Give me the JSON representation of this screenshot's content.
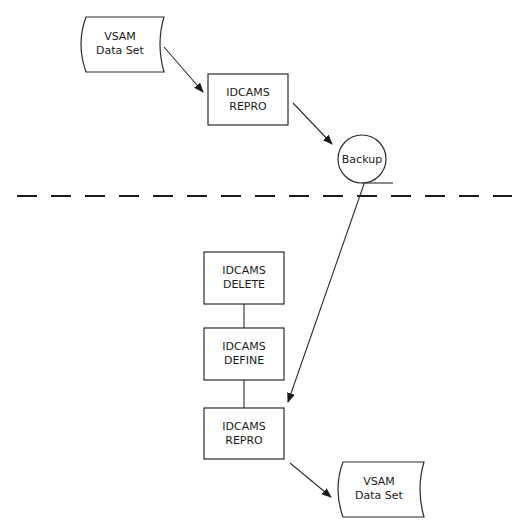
{
  "diagram": {
    "type": "flowchart",
    "nodes": {
      "vsam_top": {
        "line1": "VSAM",
        "line2": "Data Set",
        "shape": "data-set"
      },
      "repro_top": {
        "line1": "IDCAMS",
        "line2": "REPRO",
        "shape": "box"
      },
      "backup": {
        "label": "Backup",
        "shape": "tape-circle"
      },
      "delete": {
        "line1": "IDCAMS",
        "line2": "DELETE",
        "shape": "box"
      },
      "define": {
        "line1": "IDCAMS",
        "line2": "DEFINE",
        "shape": "box"
      },
      "repro_bottom": {
        "line1": "IDCAMS",
        "line2": "REPRO",
        "shape": "box"
      },
      "vsam_bottom": {
        "line1": "VSAM",
        "line2": "Data Set",
        "shape": "data-set"
      }
    },
    "edges": [
      {
        "from": "vsam_top",
        "to": "repro_top",
        "type": "arrow"
      },
      {
        "from": "repro_top",
        "to": "backup",
        "type": "arrow"
      },
      {
        "from": "backup",
        "to": "repro_bottom",
        "type": "arrow"
      },
      {
        "from": "delete",
        "to": "define",
        "type": "line"
      },
      {
        "from": "define",
        "to": "repro_bottom",
        "type": "line"
      },
      {
        "from": "repro_bottom",
        "to": "vsam_bottom",
        "type": "arrow"
      }
    ],
    "separator": "dashed-horizontal",
    "colors": {
      "stroke": "#2a2a2a",
      "text": "#1a1a1a",
      "background": "#ffffff"
    }
  }
}
